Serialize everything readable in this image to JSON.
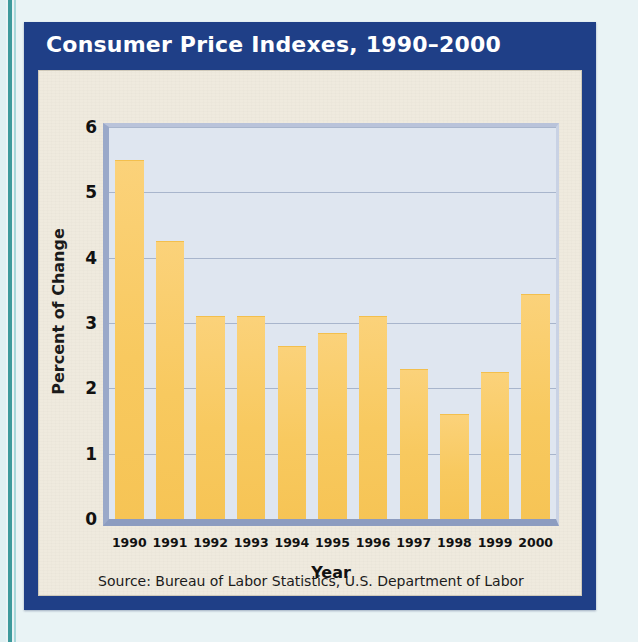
{
  "figure": {
    "title": "Consumer Price Indexes, 1990–2000",
    "source": "Source: Bureau of Labor Statistics, U.S. Department of Labor",
    "colors": {
      "frame": "#1f3f87",
      "paper": "#efeade",
      "plot_background": "#dfe6f0",
      "bar": "#f8cc6a",
      "gridline": "#9fabc6",
      "title_text": "#ffffff",
      "page_background": "#e9f3f5",
      "accent_rule": "#1f8a8c"
    }
  },
  "chart_data": {
    "type": "bar",
    "title": "Consumer Price Indexes, 1990–2000",
    "xlabel": "Year",
    "ylabel": "Percent of Change",
    "categories": [
      "1990",
      "1991",
      "1992",
      "1993",
      "1994",
      "1995",
      "1996",
      "1997",
      "1998",
      "1999",
      "2000"
    ],
    "values": [
      5.5,
      4.25,
      3.1,
      3.1,
      2.65,
      2.85,
      3.1,
      2.3,
      1.6,
      2.25,
      3.45
    ],
    "ylim": [
      0,
      6
    ],
    "yticks": [
      0,
      1,
      2,
      3,
      4,
      5,
      6
    ],
    "ytick_labels": [
      "0",
      "1",
      "2",
      "3",
      "4",
      "5",
      "6"
    ],
    "grid": true,
    "legend": false,
    "bar_color": "#f8cc6a"
  }
}
